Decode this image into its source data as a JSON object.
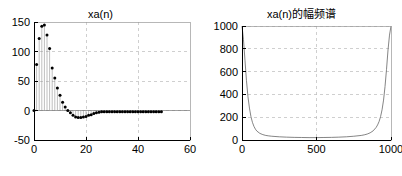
{
  "figure": {
    "background": "#ffffff",
    "width": 402,
    "height": 176
  },
  "panels": {
    "left": {
      "title": "xa(n)",
      "axis_color": "#000000",
      "grid_color": "#bbbbbb",
      "marker_color": "#000000",
      "stem_color": "#888888"
    },
    "right": {
      "title": "xa(n)的幅频谱",
      "axis_color": "#000000",
      "grid_color": "#bbbbbb",
      "line_color": "#666666"
    }
  },
  "chart_data": [
    {
      "type": "stem",
      "title": "xa(n)",
      "xlabel": "",
      "ylabel": "",
      "xlim": [
        0,
        60
      ],
      "ylim": [
        -50,
        150
      ],
      "xticks": [
        0,
        20,
        40,
        60
      ],
      "xticklabels": [
        "0",
        "20",
        "40",
        "60"
      ],
      "yticks": [
        -50,
        0,
        50,
        100,
        150
      ],
      "yticklabels": [
        "-50",
        "0",
        "50",
        "100",
        "150"
      ],
      "grid": true,
      "legend": "none",
      "x": [
        0,
        1,
        2,
        3,
        4,
        5,
        6,
        7,
        8,
        9,
        10,
        11,
        12,
        13,
        14,
        15,
        16,
        17,
        18,
        19,
        20,
        21,
        22,
        23,
        24,
        25,
        26,
        27,
        28,
        29,
        30,
        31,
        32,
        33,
        34,
        35,
        36,
        37,
        38,
        39,
        40,
        41,
        42,
        43,
        44,
        45,
        46,
        47,
        48,
        49
      ],
      "values": [
        0,
        78,
        122,
        143,
        145,
        128,
        105,
        72,
        55,
        38,
        26,
        14,
        6,
        0,
        -4,
        -8,
        -11,
        -12,
        -12,
        -11,
        -10,
        -8,
        -7,
        -5,
        -4,
        -3,
        -2,
        -2,
        -2,
        -2,
        -2,
        -2,
        -2,
        -2,
        -2,
        -2,
        -2,
        -2,
        -2,
        -2,
        -2,
        -2,
        -2,
        -2,
        -2,
        -2,
        -2,
        -2,
        -2,
        -2
      ]
    },
    {
      "type": "line",
      "title": "xa(n)的幅频谱",
      "xlabel": "",
      "ylabel": "",
      "xlim": [
        0,
        1000
      ],
      "ylim": [
        0,
        1000
      ],
      "xticks": [
        0,
        500,
        1000
      ],
      "xticklabels": [
        "0",
        "500",
        "1000"
      ],
      "yticks": [
        0,
        200,
        400,
        600,
        800,
        1000
      ],
      "yticklabels": [
        "0",
        "200",
        "400",
        "600",
        "800",
        "1000"
      ],
      "grid": true,
      "legend": "none",
      "x": [
        0,
        10,
        20,
        30,
        40,
        50,
        60,
        70,
        80,
        90,
        100,
        120,
        140,
        160,
        180,
        200,
        250,
        300,
        350,
        400,
        450,
        500,
        550,
        600,
        650,
        700,
        750,
        800,
        820,
        840,
        860,
        880,
        900,
        910,
        920,
        930,
        940,
        950,
        960,
        970,
        980,
        990,
        1000
      ],
      "values": [
        1000,
        880,
        700,
        520,
        380,
        280,
        205,
        155,
        120,
        95,
        78,
        58,
        47,
        40,
        36,
        33,
        28,
        25,
        23,
        22,
        21,
        21,
        22,
        23,
        25,
        28,
        33,
        40,
        45,
        52,
        63,
        80,
        110,
        132,
        162,
        205,
        265,
        350,
        470,
        620,
        790,
        920,
        1000
      ]
    }
  ]
}
